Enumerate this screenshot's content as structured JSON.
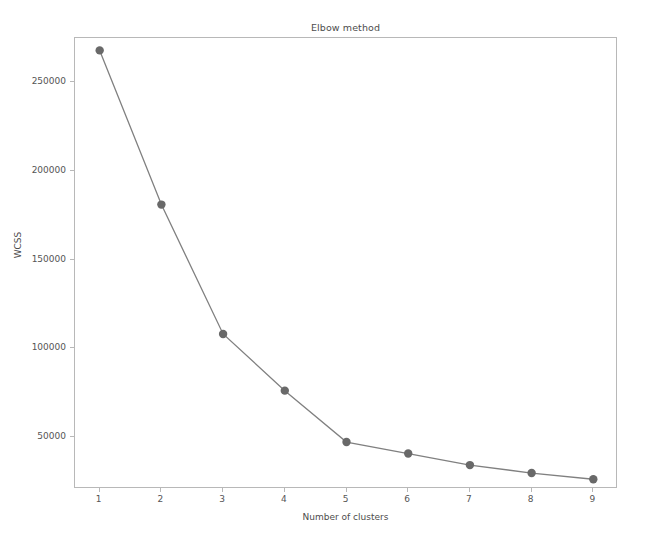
{
  "chart_data": {
    "type": "line",
    "title": "Elbow method",
    "xlabel": "Number of clusters",
    "ylabel": "WCSS",
    "x": [
      1,
      2,
      3,
      4,
      5,
      6,
      7,
      8,
      9
    ],
    "values": [
      268000,
      181000,
      108000,
      76000,
      47000,
      40500,
      34000,
      29500,
      26000
    ],
    "series": [
      {
        "name": "WCSS",
        "values": [
          268000,
          181000,
          108000,
          76000,
          47000,
          40500,
          34000,
          29500,
          26000
        ]
      }
    ],
    "xtick_labels": [
      "1",
      "2",
      "3",
      "4",
      "5",
      "6",
      "7",
      "8",
      "9"
    ],
    "ytick_labels": [
      "50000",
      "100000",
      "150000",
      "200000",
      "250000"
    ],
    "ytick_values": [
      50000,
      100000,
      150000,
      200000,
      250000
    ],
    "xlim": [
      0.6,
      9.4
    ],
    "ylim": [
      20500,
      275000
    ],
    "grid": false,
    "legend": null,
    "line_color": "#808080",
    "marker_color": "#696969",
    "marker": "circle",
    "axes_color": "#b8b8b8",
    "background_color": "#ffffff"
  }
}
